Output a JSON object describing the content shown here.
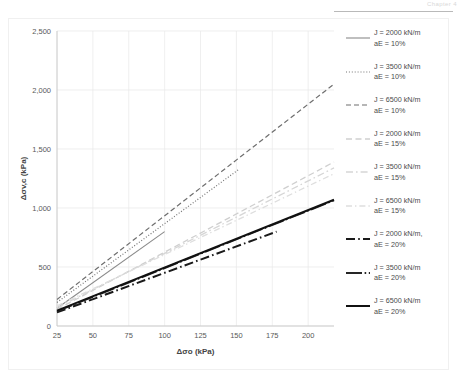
{
  "page": {
    "header_text": "Chapter 4",
    "background": "#ffffff"
  },
  "chart_data": {
    "type": "line",
    "title": "",
    "xlabel": "Δσo (kPa)",
    "ylabel": "Δσv,c (kPa)",
    "xlim": [
      25,
      218
    ],
    "ylim": [
      0,
      2500
    ],
    "xticks": [
      "25",
      "50",
      "75",
      "100",
      "125",
      "150",
      "175",
      "200"
    ],
    "xtick_values": [
      25,
      50,
      75,
      100,
      125,
      150,
      175,
      200
    ],
    "yticks": [
      "0",
      "500",
      "1,000",
      "1,500",
      "2,000",
      "2,500"
    ],
    "ytick_values": [
      0,
      500,
      1000,
      1500,
      2000,
      2500
    ],
    "grid": true,
    "legend_position": "right",
    "series": [
      {
        "name": "J = 2000 kN/m\naE = 10%",
        "label_line1": "J = 2000 kN/m",
        "label_line2": "aE = 10%",
        "style": "solid",
        "color": "#8a8a8a",
        "width": 1.1,
        "x": [
          25,
          100
        ],
        "y": [
          150,
          800
        ]
      },
      {
        "name": "J = 3500 kN/m\naE = 10%",
        "label_line1": "J = 3500 kN/m",
        "label_line2": "aE = 10%",
        "style": "dotted",
        "color": "#757575",
        "width": 1.2,
        "x": [
          25,
          152
        ],
        "y": [
          200,
          1330
        ]
      },
      {
        "name": "J = 6500 kN/m\naE = 10%",
        "label_line1": "J = 6500 kN/m",
        "label_line2": "aE = 10%",
        "style": "dashed",
        "color": "#6e6e6e",
        "width": 1.2,
        "x": [
          25,
          218
        ],
        "y": [
          225,
          2050
        ]
      },
      {
        "name": "J = 2000 kN/m\naE = 15%",
        "label_line1": "J = 2000 kN/m",
        "label_line2": "aE = 15%",
        "style": "dashed-light",
        "color": "#cfcfcf",
        "width": 1.3,
        "x": [
          25,
          218
        ],
        "y": [
          140,
          1390
        ]
      },
      {
        "name": "J = 3500 kN/m\naE = 15%",
        "label_line1": "J = 3500 kN/m",
        "label_line2": "aE = 15%",
        "style": "dashdot-light",
        "color": "#d6d6d6",
        "width": 1.3,
        "x": [
          25,
          218
        ],
        "y": [
          155,
          1340
        ]
      },
      {
        "name": "J = 6500 kN/m\naE = 15%",
        "label_line1": "J = 6500 kN/m",
        "label_line2": "aE = 15%",
        "style": "dashdot-lighter",
        "color": "#dedede",
        "width": 1.3,
        "x": [
          25,
          218
        ],
        "y": [
          170,
          1290
        ]
      },
      {
        "name": "J = 2000 kN/m, aE = 20%",
        "label_line1": "J = 2000 kN/m,",
        "label_line2": "aE = 20%",
        "style": "thick-dashdot",
        "color": "#1a1a1a",
        "width": 2.0,
        "x": [
          25,
          178
        ],
        "y": [
          115,
          800
        ]
      },
      {
        "name": "J = 3500 kN/m\naE = 20%",
        "label_line1": "J = 3500 kN/m",
        "label_line2": "aE = 20%",
        "style": "thick-dashdot2",
        "color": "#262626",
        "width": 1.8,
        "x": [
          25,
          218
        ],
        "y": [
          125,
          1065
        ]
      },
      {
        "name": "J = 6500 kN/m\naE = 20%",
        "label_line1": "J = 6500 kN/m",
        "label_line2": "aE = 20%",
        "style": "thick-solid",
        "color": "#111111",
        "width": 2.0,
        "x": [
          25,
          218
        ],
        "y": [
          130,
          1070
        ]
      }
    ]
  }
}
